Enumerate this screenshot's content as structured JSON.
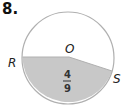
{
  "problem_number": "8.",
  "diagram": {
    "center_label": "O",
    "point_labels": [
      "R",
      "S"
    ],
    "shaded_fraction": {
      "numerator": "4",
      "denominator": "9"
    },
    "colors": {
      "shade": "#c8c8c8",
      "stroke": "#b0b0b0"
    }
  }
}
